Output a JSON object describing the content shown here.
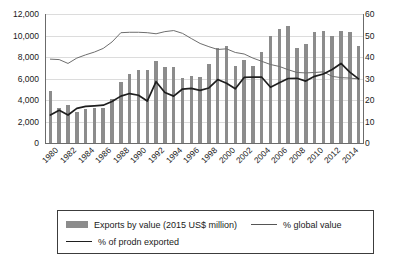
{
  "chart_data": {
    "type": "bar",
    "title": "",
    "subtitle": "",
    "xlabel": "",
    "ylabel": "",
    "ylabel_right": "",
    "grid": true,
    "legend_position": "bottom",
    "ylim": [
      0,
      12000
    ],
    "ylim_right": [
      0,
      60
    ],
    "yticks": [
      "0",
      "2,000",
      "4,000",
      "6,000",
      "8,000",
      "10,000",
      "12,000"
    ],
    "ytick_values": [
      0,
      2000,
      4000,
      6000,
      8000,
      10000,
      12000
    ],
    "yticks_right": [
      "0",
      "10",
      "20",
      "30",
      "40",
      "50",
      "60"
    ],
    "ytick_values_right": [
      0,
      10,
      20,
      30,
      40,
      50,
      60
    ],
    "categories": [
      "1980",
      "1981",
      "1982",
      "1983",
      "1984",
      "1985",
      "1986",
      "1987",
      "1988",
      "1989",
      "1990",
      "1991",
      "1992",
      "1993",
      "1994",
      "1995",
      "1996",
      "1997",
      "1998",
      "1999",
      "2000",
      "2001",
      "2002",
      "2003",
      "2004",
      "2005",
      "2006",
      "2007",
      "2008",
      "2009",
      "2010",
      "2011",
      "2012",
      "2013",
      "2014",
      "2015"
    ],
    "xtick_labels": [
      "1980",
      "1982",
      "1984",
      "1986",
      "1988",
      "1990",
      "1992",
      "1994",
      "1996",
      "1998",
      "2000",
      "2002",
      "2004",
      "2006",
      "2008",
      "2010",
      "2012",
      "2014"
    ],
    "series": [
      {
        "name": "Exports by value (2015 US$ million)",
        "type": "bar",
        "axis": "left",
        "color": "#8c8c8c",
        "values": [
          4850,
          3250,
          3550,
          2900,
          3150,
          3250,
          3300,
          4050,
          5650,
          6400,
          6800,
          6750,
          7600,
          7050,
          7050,
          6050,
          6250,
          6150,
          7350,
          8850,
          9050,
          7150,
          7750,
          7150,
          8500,
          9950,
          10650,
          10900,
          8850,
          9200,
          10350,
          10400,
          10000,
          10400,
          10350,
          9000
        ]
      },
      {
        "name": "% global value",
        "type": "line",
        "axis": "right",
        "color": "#6e6e6e",
        "values": [
          39.0,
          38.8,
          37.0,
          39.5,
          41.0,
          42.3,
          44.0,
          47.0,
          51.3,
          51.5,
          51.5,
          51.3,
          50.8,
          51.8,
          52.3,
          51.0,
          48.6,
          46.3,
          44.8,
          43.5,
          43.8,
          42.1,
          41.4,
          39.5,
          38.0,
          36.5,
          35.6,
          34.1,
          32.8,
          32.6,
          32.8,
          33.1,
          31.0,
          30.4,
          30.2,
          29.8
        ]
      },
      {
        "name": "% of prodn exported",
        "type": "line",
        "axis": "right",
        "color": "#1f1f1f",
        "values": [
          13.0,
          15.2,
          13.0,
          16.1,
          17.0,
          17.3,
          17.6,
          19.3,
          21.8,
          23.0,
          22.2,
          19.5,
          28.5,
          23.5,
          21.8,
          25.1,
          25.4,
          24.5,
          25.6,
          29.5,
          27.8,
          25.2,
          30.5,
          30.7,
          30.6,
          25.9,
          28.0,
          30.0,
          30.1,
          28.8,
          31.0,
          32.1,
          34.2,
          37.0,
          33.0,
          29.8
        ]
      }
    ]
  },
  "legend": {
    "items": [
      {
        "label": "Exports by value (2015 US$ million)",
        "marker": "bar-swatch"
      },
      {
        "label": "% global value",
        "marker": "line-thin"
      },
      {
        "label": "% of prodn exported",
        "marker": "line-thick"
      }
    ]
  }
}
